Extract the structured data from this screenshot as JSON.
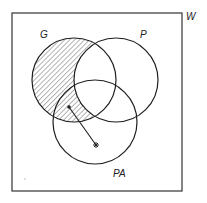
{
  "diagram": {
    "type": "venn",
    "universe_label": "W",
    "sets": [
      {
        "id": "G",
        "label": "G",
        "cx": 74,
        "cy": 80,
        "r": 42,
        "label_x": 40,
        "label_y": 38
      },
      {
        "id": "P",
        "label": "P",
        "cx": 116,
        "cy": 80,
        "r": 42,
        "label_x": 140,
        "label_y": 38
      },
      {
        "id": "PA",
        "label": "PA",
        "cx": 95,
        "cy": 122,
        "r": 42,
        "label_x": 113,
        "label_y": 177
      }
    ],
    "shaded_region": "G minus P",
    "arrow": {
      "from": [
        68,
        107
      ],
      "to": [
        96,
        145
      ],
      "from_marker": "dot",
      "to_marker": "asterisk"
    },
    "colors": {
      "line": "#1e1e1e",
      "hatch": "#444444",
      "background": "#ffffff"
    }
  }
}
